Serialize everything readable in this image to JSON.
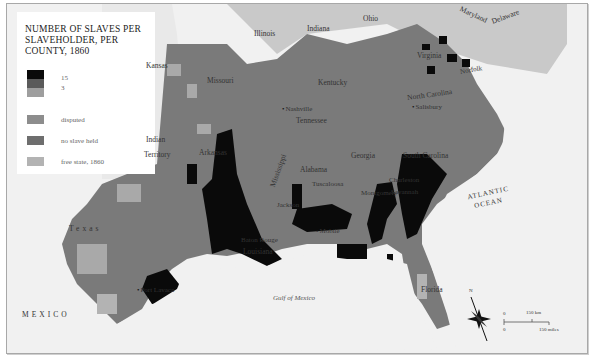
{
  "legend": {
    "title": "NUMBER OF SLAVES PER SLAVEHOLDER, PER COUNTY, 1860",
    "scale": [
      {
        "label": "15",
        "color": "#0a0a0a"
      },
      {
        "label": "",
        "color": "#5a5a5a"
      },
      {
        "label": "3",
        "color": "#9e9e9e"
      }
    ],
    "categories": [
      {
        "label": "disputed",
        "color": "#8d8d8d"
      },
      {
        "label": "no slave held",
        "color": "#6e6e6e"
      },
      {
        "label": "free state, 1860",
        "color": "#b3b3b3"
      }
    ]
  },
  "colors": {
    "background": "#f1f1f1",
    "free_state": "#c9c9c9",
    "slave_state": "#7a7a7a",
    "high_density": "#0a0a0a",
    "low_density": "#a9a9a9",
    "water": "#f1f1f1"
  },
  "labels": {
    "states": {
      "illinois": "Illinois",
      "indiana": "Indiana",
      "ohio": "Ohio",
      "maryland": "Maryland",
      "delaware": "Delaware",
      "kansas": "Kansas",
      "missouri": "Missouri",
      "kentucky": "Kentucky",
      "virginia": "Virginia",
      "north_carolina": "North Carolina",
      "tennessee": "Tennessee",
      "indian_territory_1": "Indian",
      "indian_territory_2": "Territory",
      "arkansas": "Arkansas",
      "mississippi": "Mississippi",
      "alabama": "Alabama",
      "georgia": "Georgia",
      "south_carolina": "South Carolina",
      "louisiana": "Louisiana",
      "texas": "Texas",
      "florida": "Florida",
      "mexico": "MEXICO"
    },
    "cities": {
      "nashville": "Nashville",
      "norfolk": "Norfolk",
      "salisbury": "Salisbury",
      "tuscaloosa": "Tuscaloosa",
      "jackson": "Jackson",
      "baton_rouge": "Baton Rouge",
      "new_orleans": "New Orleans",
      "mobile": "Mobile",
      "charleston": "Charleston",
      "savannah": "Savannah",
      "montgomery": "Montgomery",
      "port_lavaca": "Port Lavaca"
    },
    "water": {
      "gulf": "Gulf of Mexico",
      "atlantic_1": "ATLANTIC",
      "atlantic_2": "OCEAN"
    }
  },
  "compass": {
    "north": "N"
  },
  "scale_bar": {
    "zero_km": "0",
    "km": "150 km",
    "zero_mi": "0",
    "mi": "150 miles"
  }
}
